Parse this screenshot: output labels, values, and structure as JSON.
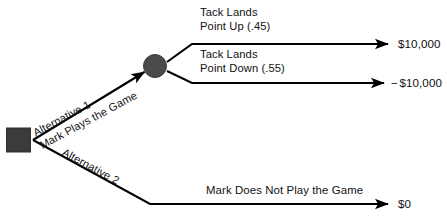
{
  "diagram": {
    "type": "decision-tree",
    "nodes": {
      "decision": {
        "name": "decision-node",
        "shape": "square",
        "color": "#3b3b3b"
      },
      "chance": {
        "name": "chance-node",
        "shape": "circle",
        "color": "#4a4a4a"
      }
    },
    "alternatives": [
      {
        "id": "alt1",
        "line1": "Alternative 1",
        "line2": "Mark Plays the Game"
      },
      {
        "id": "alt2",
        "line1": "Alternative 2",
        "line2": "Mark Does Not Play the Game"
      }
    ],
    "outcomes": [
      {
        "id": "point-up",
        "line1": "Tack Lands",
        "line2": "Point Up (.45)",
        "probability": 0.45,
        "payoff_sign": "",
        "payoff": "$10,000"
      },
      {
        "id": "point-down",
        "line1": "Tack Lands",
        "line2": "Point Down (.55)",
        "probability": 0.55,
        "payoff_sign": "−",
        "payoff": "$10,000"
      },
      {
        "id": "no-play",
        "line1": "Mark Does Not Play the Game",
        "line2": "",
        "probability": null,
        "payoff_sign": "",
        "payoff": "$0"
      }
    ],
    "colors": {
      "line": "#000000",
      "text": "#111111",
      "background": "#ffffff"
    }
  }
}
